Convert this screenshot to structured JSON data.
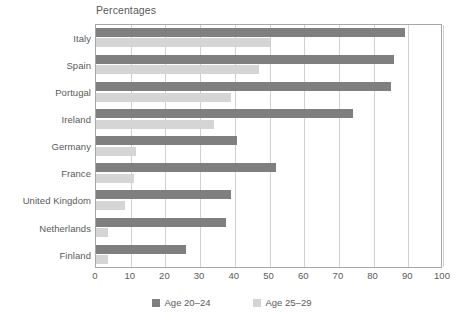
{
  "chart_data": {
    "type": "bar",
    "orientation": "horizontal",
    "title": "Percentages",
    "xlabel": "",
    "ylabel": "",
    "xlim": [
      0,
      100
    ],
    "xticks": [
      0,
      10,
      20,
      30,
      40,
      50,
      60,
      70,
      80,
      90,
      100
    ],
    "grid": "vertical",
    "legend_position": "bottom-center",
    "categories": [
      "Italy",
      "Spain",
      "Portugal",
      "Ireland",
      "Germany",
      "France",
      "United Kingdom",
      "Netherlands",
      "Finland"
    ],
    "series": [
      {
        "name": "Age 20–24",
        "color": "#7f7f7f",
        "values": [
          89,
          86,
          85,
          74,
          40.5,
          52,
          39,
          37.5,
          26
        ]
      },
      {
        "name": "Age 25–29",
        "color": "#d5d5d5",
        "values": [
          50,
          47,
          39,
          34,
          11.5,
          11,
          8.5,
          3.5,
          3.5
        ]
      }
    ]
  },
  "chart": {
    "title": "Percentages",
    "axis": {
      "tick_labels": [
        "0",
        "10",
        "20",
        "30",
        "40",
        "50",
        "60",
        "70",
        "80",
        "90",
        "100"
      ]
    },
    "legend": {
      "items": [
        {
          "label": "Age 20–24",
          "swatch": "dark"
        },
        {
          "label": "Age 25–29",
          "swatch": "light"
        }
      ]
    }
  }
}
